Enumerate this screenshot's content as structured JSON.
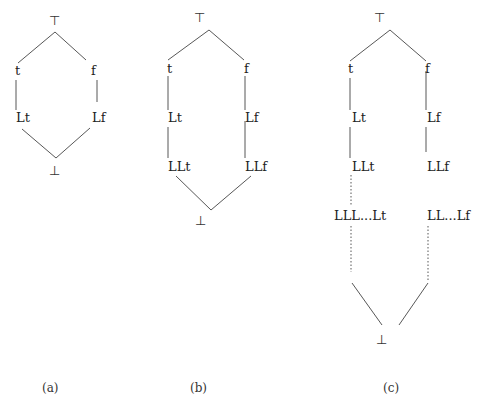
{
  "diagrams": [
    {
      "id": "a",
      "caption": "(a)",
      "nodes": {
        "top": "⊤",
        "left1": "t",
        "right1": "f",
        "left2": "Lt",
        "right2": "Lf",
        "bottom": "⊥"
      }
    },
    {
      "id": "b",
      "caption": "(b)",
      "nodes": {
        "top": "⊤",
        "left1": "t",
        "right1": "f",
        "left2": "Lt",
        "right2": "Lf",
        "left3": "LLt",
        "right3": "LLf",
        "bottom": "⊥"
      }
    },
    {
      "id": "c",
      "caption": "(c)",
      "nodes": {
        "top": "⊤",
        "left1": "t",
        "right1": "f",
        "left2": "Lt",
        "right2": "Lf",
        "left3": "LLt",
        "right3": "LLf",
        "left4": "LLL...Lt",
        "right4": "LL...Lf",
        "bottom": "⊥"
      }
    }
  ]
}
